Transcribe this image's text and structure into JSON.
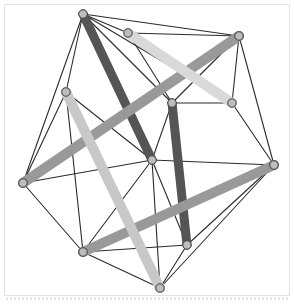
{
  "figure": {
    "canvas": {
      "width": 294,
      "height": 304
    },
    "background_color": "#ffffff",
    "frame_color": "#e2e2e2",
    "cable_color": "#2b2b2b",
    "cable_width": 1.1,
    "node_fill": "#bdbdbd",
    "node_stroke": "#4a4a4a"
  },
  "palette": {
    "dark": "#555555",
    "dark_cap": "#3d3d3d",
    "medium": "#999999",
    "medium_cap": "#777777",
    "light": "#c8c8c8",
    "light_cap": "#ababab",
    "pale": "#d9d9d9",
    "pale_cap": "#bcbcbc"
  },
  "nodes": [
    {
      "id": "n0",
      "label": "top-apex",
      "x": 83,
      "y": 14
    },
    {
      "id": "n1",
      "label": "top-right",
      "x": 239,
      "y": 36
    },
    {
      "id": "n2",
      "label": "left-apex",
      "x": 23,
      "y": 183
    },
    {
      "id": "n3",
      "label": "right-apex",
      "x": 274,
      "y": 165
    },
    {
      "id": "n4",
      "label": "bottom-left",
      "x": 83,
      "y": 252
    },
    {
      "id": "n5",
      "label": "bottom-apex",
      "x": 160,
      "y": 288
    },
    {
      "id": "n6",
      "label": "mid-upper-left",
      "x": 66,
      "y": 92
    },
    {
      "id": "n7",
      "label": "mid-center",
      "x": 172,
      "y": 103
    },
    {
      "id": "n8",
      "label": "mid-right",
      "x": 232,
      "y": 103
    },
    {
      "id": "n9",
      "label": "mid-lower",
      "x": 152,
      "y": 160
    },
    {
      "id": "n10",
      "label": "lower-center",
      "x": 187,
      "y": 245
    },
    {
      "id": "n11",
      "label": "upper-mid",
      "x": 128,
      "y": 33
    }
  ],
  "struts": [
    {
      "id": "s0",
      "label": "strut-dark-upper",
      "x1": 83,
      "y1": 14,
      "x2": 152,
      "y2": 160,
      "tone": "dark",
      "width": 9
    },
    {
      "id": "s1",
      "label": "strut-dark-vertical",
      "x1": 172,
      "y1": 103,
      "x2": 187,
      "y2": 245,
      "tone": "dark",
      "width": 9
    },
    {
      "id": "s2",
      "label": "strut-medium-long",
      "x1": 23,
      "y1": 183,
      "x2": 239,
      "y2": 36,
      "tone": "medium",
      "width": 10
    },
    {
      "id": "s3",
      "label": "strut-medium-low",
      "x1": 83,
      "y1": 252,
      "x2": 274,
      "y2": 165,
      "tone": "medium",
      "width": 10
    },
    {
      "id": "s4",
      "label": "strut-light-left",
      "x1": 66,
      "y1": 92,
      "x2": 160,
      "y2": 288,
      "tone": "light",
      "width": 10
    },
    {
      "id": "s5",
      "label": "strut-light-right",
      "x1": 128,
      "y1": 33,
      "x2": 232,
      "y2": 103,
      "tone": "pale",
      "width": 10
    }
  ],
  "cables": [
    {
      "from": "n0",
      "to": "n1"
    },
    {
      "from": "n0",
      "to": "n2"
    },
    {
      "from": "n0",
      "to": "n6"
    },
    {
      "from": "n0",
      "to": "n11"
    },
    {
      "from": "n0",
      "to": "n7"
    },
    {
      "from": "n0",
      "to": "n9"
    },
    {
      "from": "n0",
      "to": "n8"
    },
    {
      "from": "n1",
      "to": "n3"
    },
    {
      "from": "n1",
      "to": "n8"
    },
    {
      "from": "n1",
      "to": "n7"
    },
    {
      "from": "n1",
      "to": "n11"
    },
    {
      "from": "n2",
      "to": "n4"
    },
    {
      "from": "n2",
      "to": "n6"
    },
    {
      "from": "n2",
      "to": "n9"
    },
    {
      "from": "n3",
      "to": "n5"
    },
    {
      "from": "n3",
      "to": "n9"
    },
    {
      "from": "n3",
      "to": "n10"
    },
    {
      "from": "n3",
      "to": "n8"
    },
    {
      "from": "n4",
      "to": "n5"
    },
    {
      "from": "n4",
      "to": "n6"
    },
    {
      "from": "n4",
      "to": "n9"
    },
    {
      "from": "n4",
      "to": "n10"
    },
    {
      "from": "n5",
      "to": "n10"
    },
    {
      "from": "n5",
      "to": "n9"
    },
    {
      "from": "n6",
      "to": "n9"
    },
    {
      "from": "n7",
      "to": "n9"
    },
    {
      "from": "n7",
      "to": "n8"
    },
    {
      "from": "n7",
      "to": "n10"
    },
    {
      "from": "n9",
      "to": "n10"
    },
    {
      "from": "n11",
      "to": "n7"
    }
  ]
}
